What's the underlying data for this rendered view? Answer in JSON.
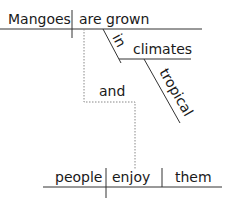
{
  "diagram": {
    "type": "sentence-diagram",
    "clause1": {
      "subject": "Mangoes",
      "predicate": "are grown",
      "modifier_preposition": "in",
      "prepositional_object": "climates",
      "adjective": "tropical"
    },
    "conjunction": "and",
    "clause2": {
      "subject": "people",
      "predicate": "enjoy",
      "object": "them"
    },
    "colors": {
      "line": "#333333",
      "dotted": "#888888",
      "text": "#1a1a1a"
    }
  }
}
